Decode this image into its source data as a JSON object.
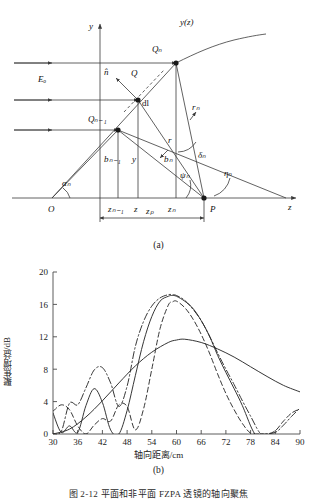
{
  "figure": {
    "subfig_a_label": "(a)",
    "subfig_b_label": "(b)",
    "caption": "图 2-12   平面和非平面 FZPA 透镜的轴向聚焦"
  },
  "diagram": {
    "name": "fresnel-zone-plate-geometry",
    "axes": {
      "y_axis_label": "y",
      "z_axis_label": "z"
    },
    "labels": {
      "curve": "y(z)",
      "incident_field": "Eₒ",
      "normal_vector": "n̂",
      "point_Q": "Q",
      "point_Qn": "Qₙ",
      "point_Qn1": "Qₙ₋₁",
      "element": "dl",
      "point_O": "O",
      "point_P": "P",
      "height_y": "y",
      "height_bn": "bₙ",
      "height_bn1": "bₙ₋₁",
      "dist_r": "r",
      "dist_rn": "rₙ",
      "angle_alpha_n": "αₙ",
      "angle_psi_n": "ψₙ",
      "angle_delta_n": "δₙ",
      "angle_eta_n": "ηₙ",
      "tick_zn1": "zₙ₋₁",
      "tick_z": "z",
      "tick_zn": "zₙ",
      "span_zp": "zₚ"
    },
    "colors": {
      "line": "#3a3a3a",
      "text": "#1a1a1a"
    }
  },
  "chart_data": {
    "type": "line",
    "title": "",
    "xlabel": "轴向距离/cm",
    "ylabel": "聚焦增益/dB",
    "xlim": [
      30,
      90
    ],
    "ylim": [
      0,
      20
    ],
    "xticks": [
      30,
      36,
      42,
      48,
      54,
      60,
      66,
      72,
      78,
      84,
      90
    ],
    "yticks": [
      0,
      4,
      8,
      12,
      16,
      20
    ],
    "grid": false,
    "legend": "none",
    "series": [
      {
        "name": "curve-1-solid-broad",
        "style": "solid",
        "x": [
          30,
          34,
          38,
          42,
          46,
          50,
          54,
          58,
          60,
          62,
          66,
          70,
          74,
          78,
          82,
          86,
          90
        ],
        "y": [
          0.0,
          0.6,
          2.1,
          4.1,
          6.3,
          8.4,
          10.1,
          11.3,
          11.6,
          11.7,
          11.3,
          10.5,
          9.5,
          8.3,
          7.1,
          6.0,
          5.2
        ]
      },
      {
        "name": "curve-2-solid-narrow",
        "style": "solid",
        "x": [
          30,
          32,
          34,
          36,
          38,
          40,
          42,
          44,
          46,
          48,
          50,
          52,
          54,
          56,
          58,
          59,
          60,
          62,
          64,
          66,
          68,
          70,
          72,
          74,
          76,
          78,
          79
        ],
        "y": [
          2.6,
          0.2,
          1.0,
          0.2,
          3.5,
          5.6,
          3.9,
          0.5,
          0.0,
          2.9,
          7.2,
          11.4,
          14.5,
          16.4,
          17.0,
          17.1,
          17.0,
          16.4,
          15.5,
          14.0,
          12.1,
          9.7,
          7.6,
          5.6,
          3.5,
          1.0,
          0.0
        ]
      },
      {
        "name": "curve-3-dashed",
        "style": "dashed",
        "x": [
          30,
          32,
          34,
          36,
          38,
          40,
          42,
          44,
          46,
          48,
          50,
          52,
          54,
          56,
          58,
          59,
          60,
          62,
          64,
          66,
          68,
          70,
          72,
          74,
          76,
          78,
          80,
          82,
          84,
          86,
          88,
          90
        ],
        "y": [
          2.8,
          3.6,
          3.0,
          1.0,
          0.0,
          1.1,
          1.9,
          1.6,
          3.6,
          3.4,
          0.5,
          3.1,
          8.0,
          13.0,
          15.9,
          16.3,
          16.4,
          15.6,
          14.2,
          12.3,
          10.0,
          7.4,
          5.0,
          3.0,
          1.3,
          0.1,
          0.0,
          0.0,
          0.4,
          1.6,
          2.6,
          3.1
        ]
      },
      {
        "name": "curve-4-dash-dot",
        "style": "dashdot",
        "x": [
          30,
          32,
          34,
          36,
          38,
          40,
          42,
          44,
          46,
          48,
          50,
          52,
          54,
          56,
          58,
          59,
          60,
          62,
          64,
          66,
          68,
          70,
          72,
          74,
          76,
          78,
          80,
          81,
          84,
          86,
          88,
          90
        ],
        "y": [
          0.0,
          0.3,
          3.8,
          3.6,
          5.7,
          7.9,
          8.2,
          6.3,
          3.4,
          5.9,
          10.8,
          13.9,
          15.8,
          16.8,
          17.2,
          17.2,
          17.1,
          16.5,
          15.4,
          14.0,
          12.1,
          10.0,
          8.0,
          6.1,
          4.1,
          2.2,
          0.3,
          0.0,
          0.2,
          1.1,
          2.2,
          3.2
        ]
      }
    ],
    "colors": {
      "line": "#2b2b2b",
      "axis": "#4a4a4a"
    }
  }
}
